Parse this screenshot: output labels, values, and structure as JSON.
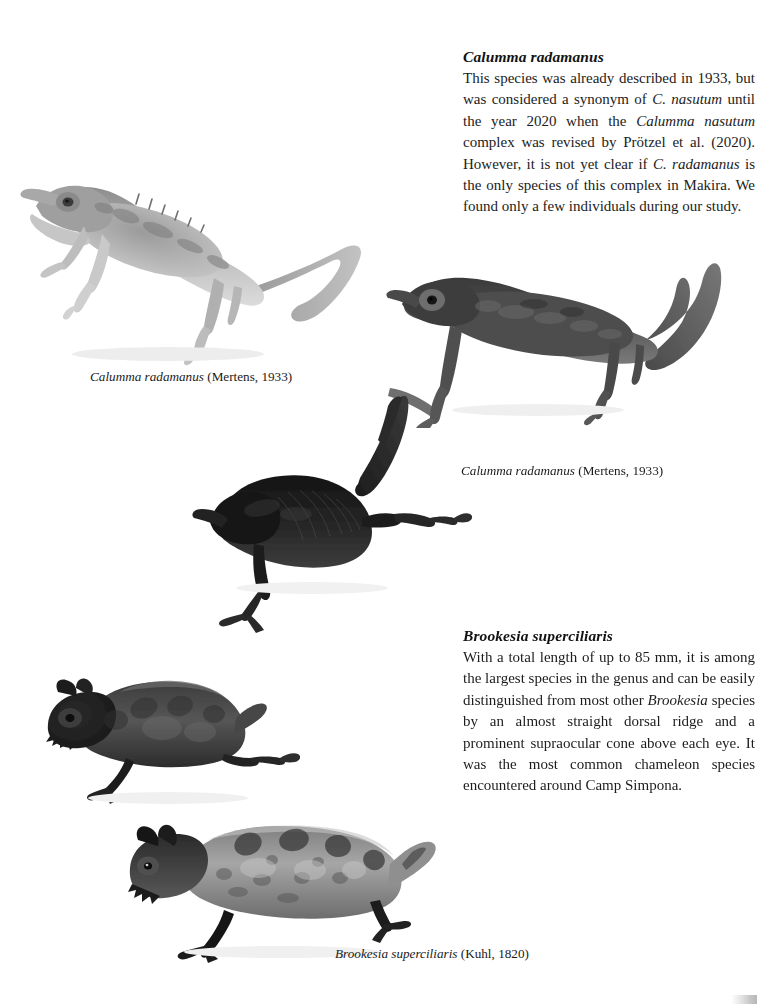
{
  "page": {
    "background_color": "#ffffff",
    "text_color": "#1a1a1a",
    "width": 761,
    "height": 1006
  },
  "sections": [
    {
      "id": "calumma-radamanus",
      "heading": "Calumma radamanus",
      "body_plain": "This species was already described in 1933, but was considered a synonym of C. nasutum until the year 2020 when the Calumma nasutum complex was revised by Prötzel et al. (2020). However, it is not yet clear if C. radamanus is the only species of this complex in Makira. We found only a few individuals during our study.",
      "body_lines": [
        "This species was already described in 1933,",
        "but was considered a synonym of C. nasu-",
        "tum until the year 2020 when the Calumma",
        "nasutum complex was revised by Prötzel et al.",
        "(2020). However, it is not yet clear if C. rada-",
        "manus is the only species of this complex in",
        "Makira. We found only a few individuals du-",
        "ring our study."
      ]
    },
    {
      "id": "brookesia-superciliaris",
      "heading": "Brookesia superciliaris",
      "body_plain": "With a total length of up to 85 mm, it is among the largest species in the genus and can be easily distinguished from most other Brookesia species by an almost straight dorsal ridge and a prominent supraocular cone above each eye. It was the most common chameleon species encountered around Camp Simpona.",
      "body_lines": [
        "With a total length of up to 85 mm, it is",
        "among the largest species in the genus and",
        "can be easily distinguished from most other",
        "Brookesia species by an almost straight dor-",
        "sal ridge and a prominent supraocular cone",
        "above each eye. It was the most common cha-",
        "meleon species encountered around Camp",
        "Simpona."
      ]
    }
  ],
  "captions": [
    {
      "id": "caption-1",
      "scientific_name": "Calumma radamanus",
      "authority": " (Mertens, 1933)",
      "full": "Calumma radamanus (Mertens, 1933)"
    },
    {
      "id": "caption-2",
      "scientific_name": "Calumma radamanus",
      "authority": " (Mertens, 1933)",
      "full": "Calumma radamanus (Mertens, 1933)"
    },
    {
      "id": "caption-3",
      "scientific_name": "Brookesia superciliaris",
      "authority": " (Kuhl, 1820)",
      "full": "Brookesia superciliaris (Kuhl, 1820)"
    }
  ],
  "photos": [
    {
      "id": "photo-calumma-pale",
      "subject": "Calumma radamanus",
      "description": "Pale grey chameleon in left profile with pointed rostral appendage, dorsal spines and long curling tail",
      "tone": "light-grey"
    },
    {
      "id": "photo-calumma-dark",
      "subject": "Calumma radamanus",
      "description": "Dark chameleon in left profile with long tail arching upward to the right",
      "tone": "dark-grey"
    },
    {
      "id": "photo-calumma-black",
      "subject": "Calumma radamanus",
      "description": "Near-black chameleon seen from above-side with tail sweeping upward",
      "tone": "black"
    },
    {
      "id": "photo-brookesia-dark",
      "subject": "Brookesia superciliaris",
      "description": "Stumpy dark Brookesia with short tail and supraocular cones",
      "tone": "dark-grey"
    },
    {
      "id": "photo-brookesia-pale",
      "subject": "Brookesia superciliaris",
      "description": "Mottled grey Brookesia in left profile with straight dorsal ridge and short tail",
      "tone": "mid-grey"
    }
  ]
}
